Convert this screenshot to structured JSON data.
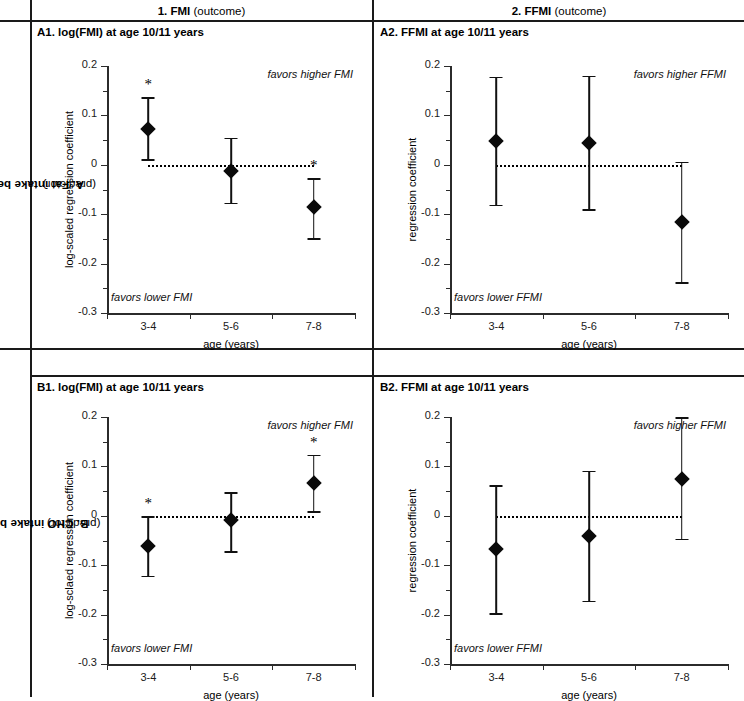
{
  "figure": {
    "columns": [
      {
        "id": "col-fmi",
        "number": "1.",
        "name": "FMI",
        "qualifier": "(outcome)"
      },
      {
        "id": "col-ffmi",
        "number": "2.",
        "name": "FFMI",
        "qualifier": "(outcome)"
      }
    ],
    "rows": [
      {
        "id": "row-a",
        "label": "A. Fat intake before 11 a.m.",
        "qualifier": "(predictor)"
      },
      {
        "id": "row-b",
        "label": "B. CHO intake before 11 a.m.",
        "qualifier": "(predictor)"
      }
    ],
    "axis_color": "#2b2b2b",
    "marker_color": "#0a0a0a",
    "frame_color": "#1a1a1a"
  },
  "chart_data": [
    {
      "id": "A1",
      "type": "scatter",
      "title": "A1. log(FMI) at age 10/11 years",
      "xlabel": "age (years)",
      "ylabel": "log-scaled regression coefficient",
      "categories": [
        "3-4",
        "5-6",
        "7-8"
      ],
      "values": [
        0.072,
        -0.013,
        -0.086
      ],
      "ci_low": [
        0.011,
        -0.077,
        -0.148
      ],
      "ci_high": [
        0.137,
        0.055,
        -0.027
      ],
      "significance": [
        "*",
        "",
        "*"
      ],
      "ylim": [
        -0.3,
        0.2
      ],
      "yticks": [
        "0.2",
        "0.1",
        "0",
        "-0.1",
        "-0.2",
        "-0.3"
      ],
      "ytickvalues": [
        0.2,
        0.1,
        0,
        -0.1,
        -0.2,
        -0.3
      ],
      "reference_line": 0,
      "annotation_high": "favors higher FMI",
      "annotation_low": "favors lower FMI",
      "grid": false
    },
    {
      "id": "A2",
      "type": "scatter",
      "title": "A2. FFMI at age 10/11 years",
      "xlabel": "age (years)",
      "ylabel": "regression coefficient",
      "categories": [
        "3-4",
        "5-6",
        "7-8"
      ],
      "values": [
        0.049,
        0.044,
        -0.115
      ],
      "ci_low": [
        -0.081,
        -0.09,
        -0.238
      ],
      "ci_high": [
        0.178,
        0.18,
        0.006
      ],
      "significance": [
        "",
        "",
        ""
      ],
      "ylim": [
        -0.3,
        0.2
      ],
      "yticks": [
        "0.2",
        "0.1",
        "0",
        "-0.1",
        "-0.2",
        "-0.3"
      ],
      "ytickvalues": [
        0.2,
        0.1,
        0,
        -0.1,
        -0.2,
        -0.3
      ],
      "reference_line": 0,
      "annotation_high": "favors higher FFMI",
      "annotation_low": "favors lower FFMI",
      "grid": false
    },
    {
      "id": "B1",
      "type": "scatter",
      "title": "B1. log(FMI) at age 10/11 years",
      "xlabel": "age (years)",
      "ylabel": "log-sclaed regression coefficient",
      "categories": [
        "3-4",
        "5-6",
        "7-8"
      ],
      "values": [
        -0.061,
        -0.009,
        0.067
      ],
      "ci_low": [
        -0.121,
        -0.072,
        0.009
      ],
      "ci_high": [
        -0.001,
        0.048,
        0.124
      ],
      "significance": [
        "*",
        "",
        "*"
      ],
      "ylim": [
        -0.3,
        0.2
      ],
      "yticks": [
        "0.2",
        "0.1",
        "0",
        "-0.1",
        "-0.2",
        "-0.3"
      ],
      "ytickvalues": [
        0.2,
        0.1,
        0,
        -0.1,
        -0.2,
        -0.3
      ],
      "reference_line": 0,
      "annotation_high": "favors higher FMI",
      "annotation_low": "favors lower FMI",
      "grid": false
    },
    {
      "id": "B2",
      "type": "scatter",
      "title": "B2. FFMI at age 10/11 years",
      "xlabel": "age (years)",
      "ylabel": "regression coefficient",
      "categories": [
        "3-4",
        "5-6",
        "7-8"
      ],
      "values": [
        -0.068,
        -0.041,
        0.074
      ],
      "ci_low": [
        -0.197,
        -0.172,
        -0.046
      ],
      "ci_high": [
        0.062,
        0.091,
        0.2
      ],
      "significance": [
        "",
        "",
        ""
      ],
      "ylim": [
        -0.3,
        0.2
      ],
      "yticks": [
        "0.2",
        "0.1",
        "0",
        "-0.1",
        "-0.2",
        "-0.3"
      ],
      "ytickvalues": [
        0.2,
        0.1,
        0,
        -0.1,
        -0.2,
        -0.3
      ],
      "reference_line": 0,
      "annotation_high": "favors higher FFMI",
      "annotation_low": "favors lower FFMI",
      "grid": false
    }
  ]
}
